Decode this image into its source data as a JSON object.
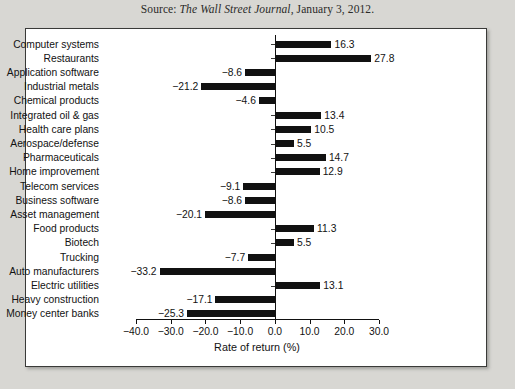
{
  "source": {
    "prefix": "Source:",
    "publication": "The Wall Street Journal",
    "suffix": ", January 3, 2012."
  },
  "chart_data": {
    "type": "bar",
    "orientation": "horizontal",
    "title": "",
    "xlabel": "Rate of return (%)",
    "ylabel": "",
    "xlim": [
      -40.0,
      30.0
    ],
    "xticks": [
      "-40.0",
      "-30.0",
      "-20.0",
      "-10.0",
      "0.0",
      "10.0",
      "20.0",
      "30.0"
    ],
    "xtick_values": [
      -40,
      -30,
      -20,
      -10,
      0,
      10,
      20,
      30
    ],
    "grid": false,
    "legend": null,
    "bar_color": "#111111",
    "categories": [
      "Computer systems",
      "Restaurants",
      "Application software",
      "Industrial metals",
      "Chemical products",
      "Integrated oil & gas",
      "Health care plans",
      "Aerospace/defense",
      "Pharmaceuticals",
      "Home improvement",
      "Telecom services",
      "Business software",
      "Asset management",
      "Food products",
      "Biotech",
      "Trucking",
      "Auto manufacturers",
      "Electric utilities",
      "Heavy construction",
      "Money center banks"
    ],
    "values": [
      16.3,
      27.8,
      -8.6,
      -21.2,
      -4.6,
      13.4,
      10.5,
      5.5,
      14.7,
      12.9,
      -9.1,
      -8.6,
      -20.1,
      11.3,
      5.5,
      -7.7,
      -33.2,
      13.1,
      -17.1,
      -25.3
    ],
    "value_labels": [
      "16.3",
      "27.8",
      "−8.6",
      "−21.2",
      "−4.6",
      "13.4",
      "10.5",
      "5.5",
      "14.7",
      "12.9",
      "−9.1",
      "−8.6",
      "−20.1",
      "11.3",
      "5.5",
      "−7.7",
      "−33.2",
      "13.1",
      "−17.1",
      "−25.3"
    ]
  }
}
